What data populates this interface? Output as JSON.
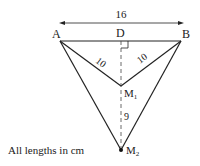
{
  "diagram": {
    "points": {
      "A": {
        "label": "A",
        "x": 60,
        "y": 41
      },
      "B": {
        "label": "B",
        "x": 181,
        "y": 41
      },
      "D": {
        "label": "D",
        "x": 121,
        "y": 41
      },
      "M1": {
        "label": "M",
        "sub": "1",
        "x": 121,
        "y": 86
      },
      "M2": {
        "label": "M",
        "sub": "2",
        "x": 121,
        "y": 150
      }
    },
    "measurements": {
      "AB": "16",
      "AM1": "10",
      "BM1": "10",
      "M1M2": "9"
    },
    "note": "All lengths in cm",
    "colors": {
      "line": "#222222",
      "background": "#ffffff"
    }
  }
}
